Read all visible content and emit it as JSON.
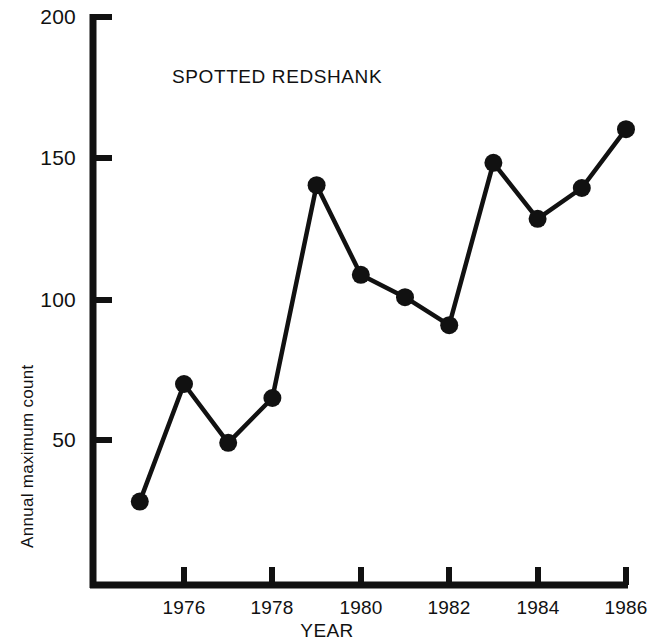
{
  "chart_data": {
    "type": "line",
    "title": "SPOTTED REDSHANK",
    "xlabel": "YEAR",
    "ylabel": "Annual maximum count",
    "x": [
      1975,
      1976,
      1977,
      1978,
      1979,
      1980,
      1981,
      1982,
      1983,
      1984,
      1985,
      1986
    ],
    "values": [
      28,
      70,
      49,
      65,
      141,
      109,
      101,
      91,
      149,
      129,
      140,
      161
    ],
    "series": [
      {
        "name": "Spotted Redshank annual maximum count",
        "values": [
          28,
          70,
          49,
          65,
          141,
          109,
          101,
          91,
          149,
          129,
          140,
          161
        ]
      }
    ],
    "xlim": [
      1974.6,
      1986.6
    ],
    "ylim": [
      0,
      205
    ],
    "xticks": [
      1976,
      1978,
      1980,
      1982,
      1984,
      1986
    ],
    "xtick_labels": [
      "1976",
      "1978",
      "1980",
      "1982",
      "1984",
      "1986"
    ],
    "yticks": [
      50,
      100,
      150,
      200
    ],
    "ytick_labels": [
      "50",
      "100",
      "150",
      "200"
    ],
    "grid": false,
    "legend": "none",
    "marker": "filled-circle",
    "line_color": "#111111",
    "marker_color": "#111111",
    "background": "#ffffff"
  },
  "axes": {
    "x_title": "YEAR",
    "y_title": "Annual maximum count"
  },
  "annotations": {
    "title_text": "SPOTTED REDSHANK"
  }
}
